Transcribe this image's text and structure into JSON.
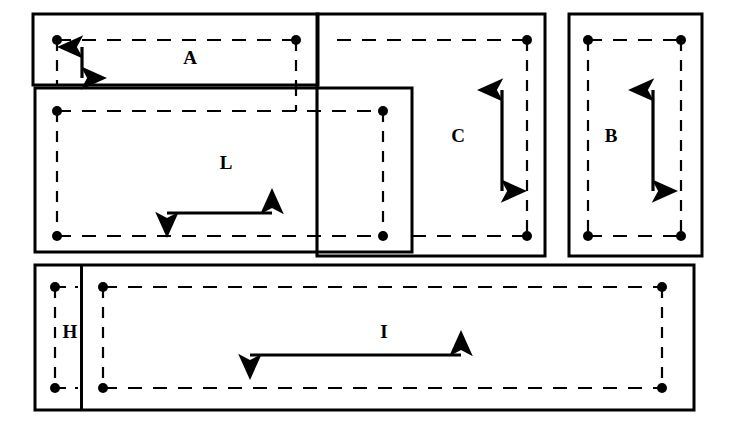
{
  "figure": {
    "background_color": "#ffffff",
    "line_color": "#000000",
    "accent_grey": "#7a7a7a",
    "width": 734,
    "height": 428
  },
  "labels": {
    "a": "A",
    "l": "L",
    "c": "C",
    "b": "B",
    "h": "H",
    "i": "I"
  },
  "regions": [
    {
      "id": "region-a",
      "label": "A",
      "box": {
        "x": 33,
        "y": 14,
        "w": 285,
        "h": 71
      },
      "dashed": {
        "x": 57,
        "y": 40,
        "w": 239,
        "h": 45
      },
      "arrow": {
        "orientation": "vertical",
        "x": 82,
        "y1": 47,
        "y2": 78
      },
      "label_pos": {
        "x": 190,
        "y": 60
      }
    },
    {
      "id": "region-l",
      "label": "L",
      "box": {
        "x": 35,
        "y": 88,
        "w": 377,
        "h": 164
      },
      "dashed": {
        "x": 57,
        "y": 111,
        "w": 326,
        "h": 125
      },
      "arrow": {
        "orientation": "horizontal",
        "y": 213,
        "x1": 167,
        "x2": 272
      },
      "label_pos": {
        "x": 226,
        "y": 165
      }
    },
    {
      "id": "region-c",
      "label": "C",
      "box": {
        "x": 317,
        "y": 14,
        "w": 228,
        "h": 242
      },
      "dashed": {
        "x": 337,
        "y": 40,
        "w": 190,
        "h": 196
      },
      "arrow": {
        "orientation": "vertical",
        "x": 502,
        "y1": 90,
        "y2": 191
      },
      "label_pos": {
        "x": 458,
        "y": 138
      }
    },
    {
      "id": "region-b",
      "label": "B",
      "box": {
        "x": 569,
        "y": 14,
        "w": 133,
        "h": 242
      },
      "dashed": {
        "x": 588,
        "y": 40,
        "w": 93,
        "h": 196
      },
      "arrow": {
        "orientation": "vertical",
        "x": 653,
        "y1": 90,
        "y2": 191
      },
      "label_pos": {
        "x": 611,
        "y": 138
      }
    },
    {
      "id": "region-h",
      "label": "H",
      "box": {
        "x": 35,
        "y": 265,
        "w": 46,
        "h": 145
      },
      "dashed": {
        "x": 55,
        "y": 287,
        "w": 72,
        "h": 101
      },
      "arrow": {
        "orientation": "vertical",
        "x": 55,
        "y1": 293,
        "y2": 382
      },
      "label_pos": {
        "x": 70,
        "y": 334
      }
    },
    {
      "id": "region-i",
      "label": "I",
      "box": {
        "x": 82,
        "y": 265,
        "w": 612,
        "h": 145
      },
      "dashed": {
        "x": 103,
        "y": 287,
        "w": 559,
        "h": 101
      },
      "arrow": {
        "orientation": "horizontal",
        "y": 355,
        "x1": 250,
        "x2": 461
      },
      "label_pos": {
        "x": 384,
        "y": 334
      }
    }
  ],
  "guides": {
    "grey_vertical": {
      "x": 317,
      "y1": 85,
      "y2": 256
    }
  },
  "nodes": [
    {
      "x": 57,
      "y": 40
    },
    {
      "x": 296,
      "y": 40
    },
    {
      "x": 527,
      "y": 40
    },
    {
      "x": 588,
      "y": 40
    },
    {
      "x": 681,
      "y": 40
    },
    {
      "x": 57,
      "y": 111
    },
    {
      "x": 383,
      "y": 111
    },
    {
      "x": 57,
      "y": 236
    },
    {
      "x": 383,
      "y": 236
    },
    {
      "x": 527,
      "y": 236
    },
    {
      "x": 588,
      "y": 236
    },
    {
      "x": 681,
      "y": 236
    },
    {
      "x": 55,
      "y": 287
    },
    {
      "x": 103,
      "y": 287
    },
    {
      "x": 662,
      "y": 287
    },
    {
      "x": 55,
      "y": 388
    },
    {
      "x": 103,
      "y": 388
    },
    {
      "x": 662,
      "y": 388
    }
  ]
}
